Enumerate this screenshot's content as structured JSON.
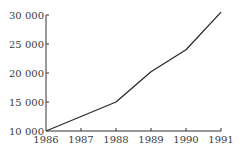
{
  "chart_data": {
    "type": "line",
    "title": "",
    "xlabel": "",
    "ylabel": "",
    "x": [
      1986,
      1987,
      1988,
      1989,
      1990,
      1991
    ],
    "categories": [
      "1986",
      "1987",
      "1988",
      "1989",
      "1990",
      "1991"
    ],
    "series": [
      {
        "name": "value",
        "values": [
          10000,
          12500,
          15000,
          20200,
          24000,
          30500
        ]
      }
    ],
    "ylim": [
      10000,
      30000
    ],
    "yticks": [
      10000,
      15000,
      20000,
      25000,
      30000
    ],
    "ytick_labels": [
      "10 000",
      "15 000",
      "20 000",
      "25 000",
      "30 000"
    ],
    "xtick_labels": [
      "1986",
      "1987",
      "1988",
      "1989",
      "1990",
      "1991"
    ],
    "grid": false,
    "legend": null,
    "line_color": "#2a2a2a"
  }
}
